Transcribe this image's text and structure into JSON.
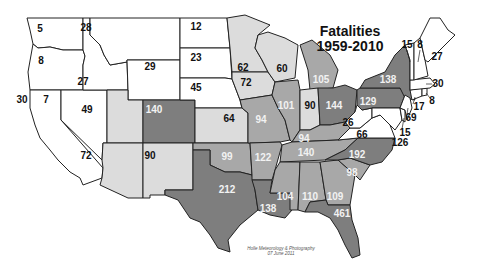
{
  "title": {
    "line1": "Fatalities",
    "line2": "1959-2010"
  },
  "credit": {
    "line1": "Holle Meteorology & Photography",
    "line2": "07 June 2011"
  },
  "shading": {
    "white": "#ffffff",
    "light": "#dcdcdc",
    "medium": "#a8a8a8",
    "dark": "#7e7e7e"
  },
  "states": [
    {
      "id": "WA",
      "value": "5",
      "shade": "white",
      "lx": 40,
      "ly": 29
    },
    {
      "id": "OR",
      "value": "8",
      "shade": "white",
      "lx": 41,
      "ly": 61
    },
    {
      "id": "CA",
      "value": "30",
      "shade": "white",
      "lx": 22,
      "ly": 100
    },
    {
      "id": "NV",
      "value": "7",
      "shade": "white",
      "lx": 46,
      "ly": 100
    },
    {
      "id": "ID",
      "value": "27",
      "shade": "white",
      "lx": 83,
      "ly": 82
    },
    {
      "id": "MT",
      "value": "28",
      "shade": "white",
      "lx": 86,
      "ly": 28
    },
    {
      "id": "WY",
      "value": "29",
      "shade": "white",
      "lx": 150,
      "ly": 67
    },
    {
      "id": "UT",
      "value": "49",
      "shade": "light",
      "lx": 87,
      "ly": 110
    },
    {
      "id": "CO",
      "value": "140",
      "shade": "dark",
      "lx": 154,
      "ly": 110
    },
    {
      "id": "AZ",
      "value": "72",
      "shade": "light",
      "lx": 86,
      "ly": 156
    },
    {
      "id": "NM",
      "value": "90",
      "shade": "light",
      "lx": 150,
      "ly": 156
    },
    {
      "id": "ND",
      "value": "12",
      "shade": "white",
      "lx": 196,
      "ly": 27
    },
    {
      "id": "SD",
      "value": "23",
      "shade": "white",
      "lx": 196,
      "ly": 58
    },
    {
      "id": "NE",
      "value": "45",
      "shade": "white",
      "lx": 196,
      "ly": 88
    },
    {
      "id": "KS",
      "value": "64",
      "shade": "light",
      "lx": 229,
      "ly": 119
    },
    {
      "id": "OK",
      "value": "99",
      "shade": "medium",
      "lx": 227,
      "ly": 157
    },
    {
      "id": "TX",
      "value": "212",
      "shade": "dark",
      "lx": 227,
      "ly": 190
    },
    {
      "id": "MN",
      "value": "62",
      "shade": "light",
      "lx": 243,
      "ly": 68
    },
    {
      "id": "IA",
      "value": "72",
      "shade": "light",
      "lx": 246,
      "ly": 83
    },
    {
      "id": "MO",
      "value": "94",
      "shade": "medium",
      "lx": 261,
      "ly": 120
    },
    {
      "id": "AR",
      "value": "122",
      "shade": "medium",
      "lx": 263,
      "ly": 158
    },
    {
      "id": "LA",
      "value": "138",
      "shade": "dark",
      "lx": 268,
      "ly": 209
    },
    {
      "id": "WI",
      "value": "60",
      "shade": "light",
      "lx": 282,
      "ly": 69
    },
    {
      "id": "IL",
      "value": "101",
      "shade": "medium",
      "lx": 286,
      "ly": 106
    },
    {
      "id": "MI",
      "value": "105",
      "shade": "medium",
      "lx": 321,
      "ly": 80
    },
    {
      "id": "IN",
      "value": "90",
      "shade": "light",
      "lx": 310,
      "ly": 106
    },
    {
      "id": "OH",
      "value": "144",
      "shade": "dark",
      "lx": 334,
      "ly": 106
    },
    {
      "id": "KY",
      "value": "94",
      "shade": "medium",
      "lx": 304,
      "ly": 139
    },
    {
      "id": "TN",
      "value": "140",
      "shade": "medium",
      "lx": 306,
      "ly": 153
    },
    {
      "id": "MS",
      "value": "104",
      "shade": "medium",
      "lx": 285,
      "ly": 197
    },
    {
      "id": "AL",
      "value": "110",
      "shade": "medium",
      "lx": 310,
      "ly": 197
    },
    {
      "id": "GA",
      "value": "109",
      "shade": "medium",
      "lx": 335,
      "ly": 197
    },
    {
      "id": "FL",
      "value": "461",
      "shade": "dark",
      "lx": 342,
      "ly": 214
    },
    {
      "id": "SC",
      "value": "98",
      "shade": "medium",
      "lx": 352,
      "ly": 173
    },
    {
      "id": "NC",
      "value": "192",
      "shade": "dark",
      "lx": 357,
      "ly": 155
    },
    {
      "id": "VA",
      "value": "66",
      "shade": "white",
      "lx": 362,
      "ly": 135
    },
    {
      "id": "WV",
      "value": "26",
      "shade": "white",
      "lx": 348,
      "ly": 123
    },
    {
      "id": "PA",
      "value": "129",
      "shade": "dark",
      "lx": 368,
      "ly": 102
    },
    {
      "id": "NY",
      "value": "138",
      "shade": "dark",
      "lx": 388,
      "ly": 80
    },
    {
      "id": "VT",
      "value": "15",
      "shade": "white",
      "lx": 407,
      "ly": 45
    },
    {
      "id": "NH",
      "value": "8",
      "shade": "white",
      "lx": 420,
      "ly": 45
    },
    {
      "id": "ME",
      "value": "27",
      "shade": "white",
      "lx": 437,
      "ly": 57
    },
    {
      "id": "MA",
      "value": "30",
      "shade": "white",
      "lx": 438,
      "ly": 84
    },
    {
      "id": "RI",
      "value": "8",
      "shade": "white",
      "lx": 432,
      "ly": 101
    },
    {
      "id": "CT",
      "value": "17",
      "shade": "white",
      "lx": 419,
      "ly": 107
    },
    {
      "id": "NJ",
      "value": "69",
      "shade": "white",
      "lx": 411,
      "ly": 118
    },
    {
      "id": "DE",
      "value": "15",
      "shade": "white",
      "lx": 405,
      "ly": 133
    },
    {
      "id": "MD",
      "value": "126",
      "shade": "white",
      "lx": 400,
      "ly": 143
    }
  ]
}
